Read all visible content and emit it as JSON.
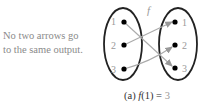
{
  "note": {
    "line1": "No two arrows go",
    "line2": "to the same output."
  },
  "diagram": {
    "function_label": "f",
    "domain": [
      "1",
      "2",
      "3"
    ],
    "codomain": [
      "1",
      "2",
      "3"
    ],
    "mapping": [
      {
        "from": "1",
        "to": "3"
      },
      {
        "from": "2",
        "to": "1"
      },
      {
        "from": "3",
        "to": "2"
      }
    ]
  },
  "caption": {
    "prefix": "(a)",
    "expr_fn": "f",
    "expr_arg": "(1) = ",
    "value": "3"
  }
}
